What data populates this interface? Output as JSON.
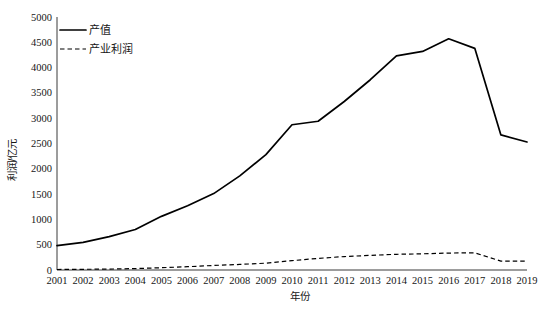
{
  "chart_data": {
    "type": "line",
    "title": "",
    "xlabel": "年份",
    "ylabel": "利润/亿元",
    "grid": false,
    "legend_position": "top-left",
    "categories": [
      "2001",
      "2002",
      "2003",
      "2004",
      "2005",
      "2006",
      "2007",
      "2008",
      "2009",
      "2010",
      "2011",
      "2012",
      "2013",
      "2014",
      "2015",
      "2016",
      "2017",
      "2018",
      "2019"
    ],
    "x": [
      2001,
      2002,
      2003,
      2004,
      2005,
      2006,
      2007,
      2008,
      2009,
      2010,
      2011,
      2012,
      2013,
      2014,
      2015,
      2016,
      2017,
      2018,
      2019
    ],
    "xlim": [
      2001,
      2019
    ],
    "ylim": [
      0,
      5000
    ],
    "yticks": [
      0,
      500,
      1000,
      1500,
      2000,
      2500,
      3000,
      3500,
      4000,
      4500,
      5000
    ],
    "ytick_labels": [
      "0",
      "500",
      "1000",
      "1500",
      "2000",
      "2500",
      "3000",
      "3500",
      "4000",
      "4500",
      "5000"
    ],
    "series": [
      {
        "name": "产值",
        "style": "solid",
        "color": "#000000",
        "values": [
          480,
          545,
          660,
          800,
          1060,
          1270,
          1510,
          1860,
          2280,
          2870,
          2940,
          3330,
          3760,
          4230,
          4320,
          4570,
          4380,
          2670,
          2530
        ]
      },
      {
        "name": "产业利润",
        "style": "dashed",
        "color": "#000000",
        "values": [
          10,
          14,
          18,
          28,
          45,
          65,
          90,
          110,
          135,
          185,
          230,
          265,
          290,
          310,
          320,
          335,
          340,
          175,
          175
        ]
      }
    ]
  },
  "legend": {
    "items": [
      {
        "label": "产值",
        "style": "solid"
      },
      {
        "label": "产业利润",
        "style": "dashed"
      }
    ]
  },
  "axes": {
    "y_title": "利润/亿元",
    "x_title": "年份"
  }
}
